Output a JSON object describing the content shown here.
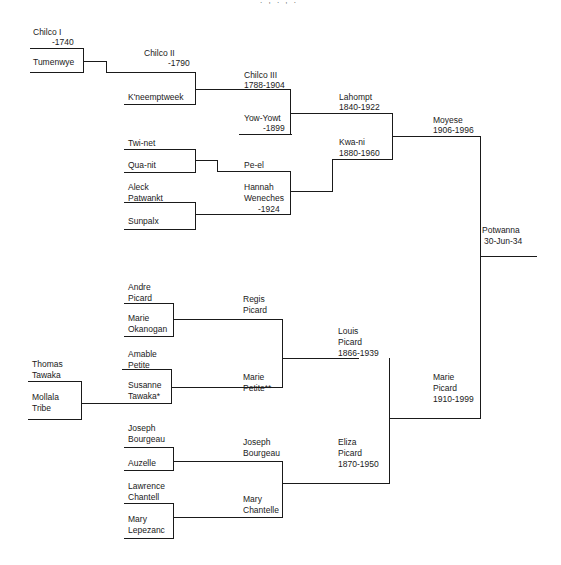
{
  "header_fragment": ". , . , .",
  "people": {
    "chilco_i": {
      "name": "Chilco   I",
      "dates": "-1740"
    },
    "tumenwye": {
      "name": "Tumenwye"
    },
    "chilco_ii": {
      "name": "Chilco   II",
      "dates": "-1790"
    },
    "kneemptweek": {
      "name": "K'neemptweek"
    },
    "chilco_iii": {
      "name": "Chilco   III",
      "dates": "1788-1904"
    },
    "yow_yowt": {
      "name": "Yow-Yowt",
      "dates": "-1899"
    },
    "lahompt": {
      "name": "Lahompt",
      "dates": "1840-1922"
    },
    "twi_net": {
      "name": "Twi-net"
    },
    "qua_nit": {
      "name": "Qua-nit"
    },
    "pe_el": {
      "name": "Pe-el"
    },
    "aleck": {
      "first": "Aleck",
      "last": "Patwankt"
    },
    "sunpalx": {
      "name": "Sunpalx"
    },
    "hannah": {
      "first": "Hannah",
      "last": "Weneches",
      "dates": "-1924"
    },
    "kwa_ni": {
      "name": "Kwa-ni",
      "dates": "1880-1960"
    },
    "moyese": {
      "name": "Moyese",
      "dates": "1906-1996"
    },
    "potwanna": {
      "name": "Potwanna",
      "dates": "30-Jun-34"
    },
    "andre": {
      "first": "Andre",
      "last": "Picard"
    },
    "marie_okanogan": {
      "first": "Marie",
      "last": "Okanogan"
    },
    "regis": {
      "first": "Regis",
      "last": "Picard"
    },
    "amable": {
      "first": "Amable",
      "last": "Petite"
    },
    "thomas": {
      "first": "Thomas",
      "last": "Tawaka"
    },
    "mollala": {
      "first": "Mollala",
      "last": "Tribe"
    },
    "susanne": {
      "first": "Susanne",
      "last": "Tawaka*"
    },
    "marie_petite": {
      "first": "Marie",
      "last": "Petite**"
    },
    "louis": {
      "first": "Louis",
      "last": "Picard",
      "dates": "1866-1939"
    },
    "marie_picard": {
      "first": "Marie",
      "last": "Picard",
      "dates": "1910-1999"
    },
    "joseph_b1": {
      "first": "Joseph",
      "last": "Bourgeau"
    },
    "auzelle": {
      "name": "Auzelle"
    },
    "joseph_b2": {
      "first": "Joseph",
      "last": "Bourgeau"
    },
    "eliza": {
      "first": "Eliza",
      "last": "Picard",
      "dates": "1870-1950"
    },
    "lawrence": {
      "first": "Lawrence",
      "last": "Chantell"
    },
    "mary_lepezanc": {
      "first": "Mary",
      "last": "Lepezanc"
    },
    "mary_chantelle": {
      "first": "Mary",
      "last": "Chantelle"
    }
  }
}
